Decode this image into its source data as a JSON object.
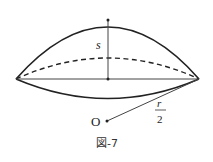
{
  "figure": {
    "caption": "図-7",
    "labels": {
      "height": "s",
      "center": "O",
      "radius_numerator": "r",
      "radius_denominator": "2"
    },
    "colors": {
      "stroke": "#222222",
      "background": "#ffffff"
    }
  }
}
